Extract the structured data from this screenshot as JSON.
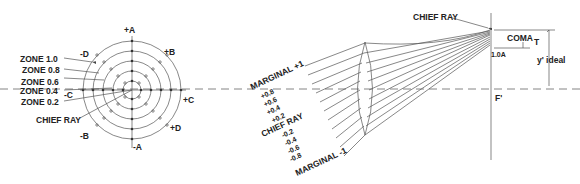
{
  "pupil": {
    "axis_labels": {
      "plus_a": "+A",
      "minus_a": "-A",
      "plus_b": "+B",
      "minus_b": "-B",
      "plus_c": "+C",
      "minus_c": "-C",
      "plus_d": "+D",
      "minus_d": "-D"
    },
    "zones": [
      {
        "label": "ZONE 1.0",
        "value": 1.0
      },
      {
        "label": "ZONE 0.8",
        "value": 0.8
      },
      {
        "label": "ZONE 0.6",
        "value": 0.6
      },
      {
        "label": "ZONE 0.4",
        "value": 0.4
      },
      {
        "label": "ZONE 0.2",
        "value": 0.2
      }
    ],
    "chief_ray_label": "CHIEF RAY"
  },
  "ray_fan": {
    "marginal_plus": "MARGINAL +1",
    "marginal_minus": "MARGINAL -1",
    "zone_labels": [
      "+0.8",
      "+0.6",
      "+0.4",
      "+0.2",
      "CHIEF RAY",
      "-0.2",
      "-0.4",
      "-0.6",
      "-0.8"
    ]
  },
  "image_plane": {
    "chief_ray_label": "CHIEF RAY",
    "coma_label": "COMA",
    "coma_subscript": "T",
    "height_label": "1.0A",
    "y_ideal_label": "y' ideal",
    "focal_point_label": "F'"
  },
  "colors": {
    "line": "#555555",
    "text": "#222222",
    "background": "#ffffff"
  }
}
